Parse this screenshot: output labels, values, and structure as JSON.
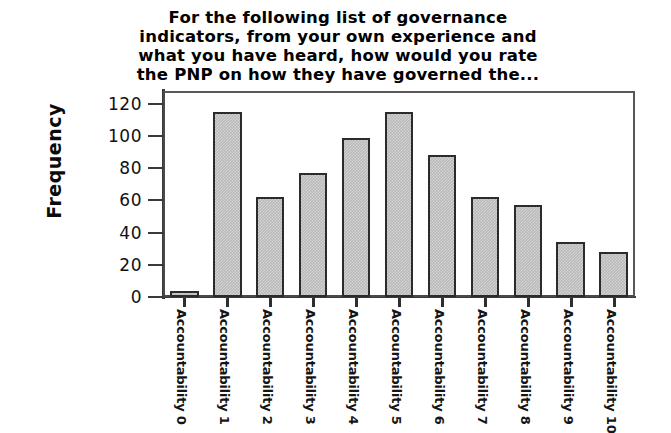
{
  "chart_data": {
    "type": "bar",
    "title": "For the following list of governance\nindicators, from your own experience and\nwhat you have heard, how would you rate\nthe PNP on how they have governed the...",
    "xlabel": "",
    "ylabel": "Frequency",
    "categories": [
      "Accountability 0",
      "Accountability 1",
      "Accountability 2",
      "Accountability 3",
      "Accountability 4",
      "Accountability 5",
      "Accountability 6",
      "Accountability 7",
      "Accountability 8",
      "Accountability 9",
      "Accountability 10"
    ],
    "values": [
      4,
      115,
      62,
      77,
      99,
      115,
      88,
      62,
      57,
      34,
      28
    ],
    "ylim": [
      0,
      128
    ],
    "yticks": [
      0,
      20,
      40,
      60,
      80,
      100,
      120
    ],
    "ytick_labels": [
      "0",
      "20",
      "40",
      "60",
      "80",
      "100",
      "120"
    ],
    "grid": false,
    "legend": false,
    "bar_fill_color": "#b9b9b9",
    "bar_edge_color": "#2b2b2b",
    "axis_color": "#3a3a3a",
    "background_color": "#ffffff"
  }
}
